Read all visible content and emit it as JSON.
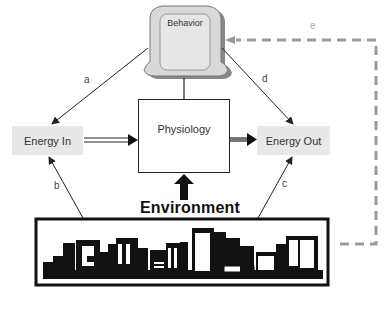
{
  "nodes": {
    "behavior": "Behavior",
    "energy_in": "Energy In",
    "physiology": "Physiology",
    "energy_out": "Energy Out",
    "environment": "Environment"
  },
  "edges": {
    "a": "a",
    "b": "b",
    "c": "c",
    "d": "d",
    "e": "e"
  },
  "colors": {
    "energy_box": "#e8e8e8",
    "dashed_feedback": "#9a9a9a",
    "behavior_fill": "#dcdcdc"
  }
}
